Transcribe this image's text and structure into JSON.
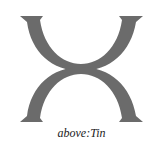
{
  "figure": {
    "symbol_name": "tin-alchemical-symbol-icon",
    "stroke_color": "#6b6b6b",
    "caption": "above:Tin"
  }
}
